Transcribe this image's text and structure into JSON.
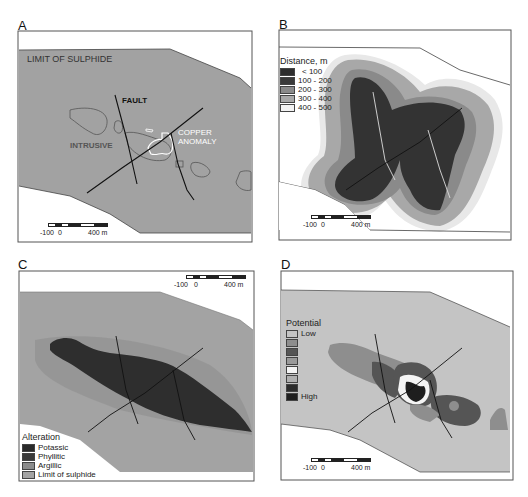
{
  "figure": {
    "panels": [
      {
        "letter": "A",
        "labels": {
          "limit": "LIMIT OF SULPHIDE",
          "fault": "FAULT",
          "intrusive": "INTRUSIVE",
          "copper1": "COPPER",
          "copper2": "ANOMALY"
        },
        "scale": {
          "left": "-100",
          "zero": "0",
          "right": "400 m"
        }
      },
      {
        "letter": "B",
        "legend": {
          "title": "Distance, m",
          "items": [
            {
              "label": "< 100",
              "color": "#2e2e2e"
            },
            {
              "label": "100 - 200",
              "color": "#3a3a3a"
            },
            {
              "label": "200 - 300",
              "color": "#8a8a8a"
            },
            {
              "label": "300 - 400",
              "color": "#a8a8a8"
            },
            {
              "label": "400 - 500",
              "color": "#f2f2f2"
            }
          ]
        },
        "scale": {
          "left": "-100",
          "zero": "0",
          "right": "400 m"
        }
      },
      {
        "letter": "C",
        "legend": {
          "title": "Alteration",
          "items": [
            {
              "label": "Potassic",
              "color": "#2a2a2a"
            },
            {
              "label": "Phyllitic",
              "color": "#3a3a3a"
            },
            {
              "label": "Argillic",
              "color": "#8c8c8c"
            },
            {
              "label": "Limit of sulphide",
              "color": "#a3a3a3"
            }
          ]
        },
        "scale": {
          "left": "-100",
          "zero": "0",
          "right": "400 m"
        }
      },
      {
        "letter": "D",
        "legend": {
          "title": "Potential",
          "low": "Low",
          "high": "High",
          "items": [
            {
              "color": "#c4c4c4"
            },
            {
              "color": "#8e8e8e"
            },
            {
              "color": "#555555"
            },
            {
              "color": "#9a9a9a"
            },
            {
              "color": "#f4f4f4"
            },
            {
              "color": "#b0b0b0"
            },
            {
              "color": "#2c2c2c"
            },
            {
              "color": "#1e1e1e"
            }
          ]
        },
        "scale": {
          "left": "-100",
          "zero": "0",
          "right": "400 m"
        }
      }
    ],
    "colors": {
      "limit_fill": "#a2a2a2",
      "frame": "#444444",
      "fault_line": "#111111",
      "anomaly_outline": "#ffffff"
    }
  }
}
